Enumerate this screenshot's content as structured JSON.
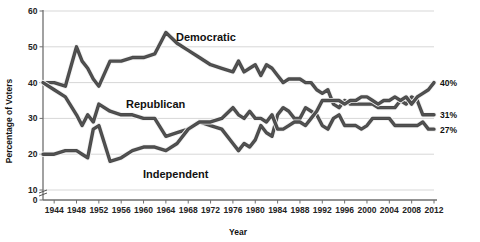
{
  "chart_data": {
    "type": "line",
    "title": "",
    "xlabel": "Year",
    "ylabel": "Percentage of Voters",
    "xlim": [
      1942,
      2012
    ],
    "ylim": [
      0,
      60
    ],
    "yticks": [
      "0",
      "10",
      "20",
      "30",
      "40",
      "50",
      "60"
    ],
    "ytick_values": [
      0,
      10,
      20,
      30,
      40,
      50,
      60
    ],
    "y_axis_break": true,
    "grid": "horizontal",
    "legend_position": "inline-labels",
    "xticks": [
      "1944",
      "1948",
      "1952",
      "1956",
      "1960",
      "1964",
      "1968",
      "1972",
      "1976",
      "1980",
      "1984",
      "1988",
      "1992",
      "1996",
      "2000",
      "2004",
      "2008",
      "2012"
    ],
    "xtick_values": [
      1944,
      1948,
      1952,
      1956,
      1960,
      1964,
      1968,
      1972,
      1976,
      1980,
      1984,
      1988,
      1992,
      1996,
      2000,
      2004,
      2008,
      2012
    ],
    "x": [
      1942,
      1944,
      1946,
      1948,
      1949,
      1950,
      1951,
      1952,
      1954,
      1956,
      1958,
      1960,
      1962,
      1964,
      1966,
      1968,
      1970,
      1972,
      1974,
      1976,
      1977,
      1978,
      1979,
      1980,
      1981,
      1982,
      1983,
      1984,
      1985,
      1986,
      1987,
      1988,
      1989,
      1990,
      1991,
      1992,
      1993,
      1994,
      1995,
      1996,
      1997,
      1998,
      1999,
      2000,
      2001,
      2002,
      2003,
      2004,
      2005,
      2006,
      2007,
      2008,
      2009,
      2010,
      2011,
      2012
    ],
    "series": [
      {
        "name": "Democratic",
        "color": "#4a4a4a",
        "end_label": "31%",
        "end_value": 31,
        "values": [
          40,
          40,
          39,
          50,
          46,
          44,
          41,
          39,
          46,
          46,
          47,
          47,
          48,
          54,
          51,
          49,
          47,
          45,
          44,
          43,
          46,
          43,
          44,
          45,
          42,
          45,
          44,
          42,
          40,
          41,
          41,
          41,
          40,
          40,
          38,
          37,
          38,
          34,
          33,
          35,
          34,
          34,
          34,
          34,
          34,
          33,
          33,
          33,
          33,
          35,
          34,
          36,
          35,
          31,
          31,
          31
        ]
      },
      {
        "name": "Republican",
        "color": "#4a4a4a",
        "end_label": "27%",
        "end_value": 27,
        "values": [
          40,
          38,
          36,
          31,
          28,
          31,
          29,
          34,
          32,
          31,
          31,
          30,
          30,
          25,
          26,
          27,
          29,
          28,
          27,
          23,
          21,
          23,
          22,
          24,
          28,
          26,
          25,
          31,
          33,
          32,
          30,
          30,
          33,
          32,
          31,
          28,
          27,
          30,
          31,
          28,
          28,
          28,
          27,
          28,
          30,
          30,
          30,
          30,
          28,
          28,
          28,
          28,
          28,
          29,
          27,
          27
        ]
      },
      {
        "name": "Independent",
        "color": "#4a4a4a",
        "end_label": "40%",
        "end_value": 40,
        "values": [
          20,
          20,
          21,
          21,
          20,
          19,
          27,
          28,
          18,
          19,
          21,
          22,
          22,
          21,
          23,
          27,
          29,
          29,
          30,
          33,
          31,
          30,
          32,
          30,
          30,
          29,
          31,
          27,
          27,
          28,
          29,
          29,
          28,
          30,
          32,
          35,
          35,
          35,
          35,
          34,
          35,
          35,
          36,
          36,
          35,
          34,
          35,
          35,
          36,
          35,
          36,
          34,
          36,
          37,
          38,
          40
        ]
      }
    ]
  }
}
